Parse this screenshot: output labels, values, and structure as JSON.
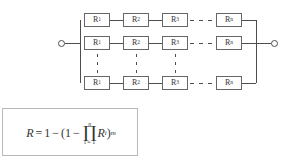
{
  "diagram": {
    "terminals": {
      "left": "terminal-node",
      "right": "terminal-node"
    },
    "columns": [
      {
        "base": "R",
        "sub": "1"
      },
      {
        "base": "R",
        "sub": "2"
      },
      {
        "base": "R",
        "sub": "3"
      },
      {
        "base": "R",
        "sub": "n"
      }
    ],
    "rows": [
      {
        "id": "row-1",
        "blocks": [
          {
            "base": "R",
            "sub": "1"
          },
          {
            "base": "R",
            "sub": "2"
          },
          {
            "base": "R",
            "sub": "3"
          },
          {
            "base": "R",
            "sub": "n"
          }
        ]
      },
      {
        "id": "row-2",
        "blocks": [
          {
            "base": "R",
            "sub": "1"
          },
          {
            "base": "R",
            "sub": "2"
          },
          {
            "base": "R",
            "sub": "3"
          },
          {
            "base": "R",
            "sub": "n"
          }
        ]
      },
      {
        "id": "row-m",
        "blocks": [
          {
            "base": "R",
            "sub": "1"
          },
          {
            "base": "R",
            "sub": "2"
          },
          {
            "base": "R",
            "sub": "3"
          },
          {
            "base": "R",
            "sub": "n"
          }
        ]
      }
    ],
    "ellipsis": {
      "horizontal_label": "dashed continuation between R3 and Rn",
      "vertical_label": "vertical dots indicating omitted rows"
    },
    "colors": {
      "wire": "#4d4d4d",
      "block_border": "#666666",
      "block_fill": "#ffffff",
      "text": "#333333",
      "formula_border": "#b8b8b8",
      "background": "#ffffff"
    }
  },
  "formula": {
    "lhs": "R",
    "equals": "=",
    "one_a": "1",
    "minus_a": "−",
    "open_paren": "(",
    "one_b": "1",
    "minus_b": "−",
    "product_symbol": "∏",
    "product_upper": "n",
    "product_lower": "i = 1",
    "product_term": "R",
    "product_term_sub": "i",
    "close_paren": ")",
    "exponent": "m",
    "plain": "R = 1 − (1 − ∏(i=1..n) Rᵢ)ᵐ"
  }
}
